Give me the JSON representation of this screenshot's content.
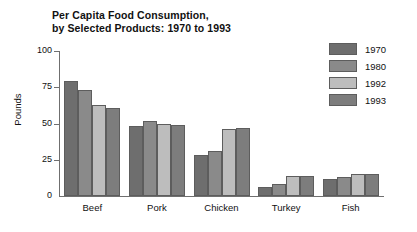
{
  "chart_data": {
    "type": "bar",
    "title": "Per Capita Food Consumption, by Selected Products: 1970 to 1993",
    "title_lines": [
      "Per Capita Food Consumption,",
      "by Selected Products: 1970 to 1993"
    ],
    "xlabel": "",
    "ylabel": "Pounds",
    "ylim": [
      0,
      100
    ],
    "yticks": [
      0,
      25,
      50,
      75,
      100
    ],
    "ytick_labels": [
      "0",
      "25",
      "50",
      "75",
      "100"
    ],
    "grid": false,
    "legend_position": "right",
    "categories": [
      "Beef",
      "Pork",
      "Chicken",
      "Turkey",
      "Fish"
    ],
    "series": [
      {
        "name": "1970",
        "color": "#6e6e6e",
        "values": [
          79,
          48,
          28,
          6,
          12
        ]
      },
      {
        "name": "1980",
        "color": "#8a8a8a",
        "values": [
          73,
          52,
          31,
          8,
          13
        ]
      },
      {
        "name": "1992",
        "color": "#bdbdbd",
        "values": [
          63,
          50,
          46,
          14,
          15
        ]
      },
      {
        "name": "1993",
        "color": "#7d7d7d",
        "values": [
          61,
          49,
          47,
          14,
          15
        ]
      }
    ]
  }
}
